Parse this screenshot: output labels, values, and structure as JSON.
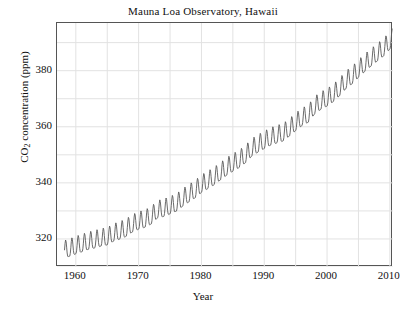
{
  "chart_data": {
    "type": "line",
    "title": "Mauna Loa Observatory, Hawaii",
    "xlabel": "Year",
    "ylabel_text": "CO",
    "ylabel_sub": "2",
    "ylabel_rest": " concentration (ppm)",
    "ylabel_full": "CO2 concentration (ppm)",
    "xlim": [
      1957.0,
      2010.5
    ],
    "ylim": [
      310.0,
      397.0
    ],
    "grid": true,
    "legend": "none",
    "xticks": [
      1960,
      1970,
      1980,
      1990,
      2000,
      2010
    ],
    "xticklabels": [
      "1960",
      "1970",
      "1980",
      "1990",
      "2000",
      "2010"
    ],
    "x_minor_step": 5,
    "yticks": [
      320,
      340,
      360,
      380
    ],
    "yticklabels": [
      "320",
      "340",
      "360",
      "380"
    ],
    "y_minor_step": 10,
    "series": [
      {
        "name": "Monthly mean CO2 (Keeling Curve)",
        "color": "#5a5a5a",
        "linewidth": 0.9,
        "description": "Monthly atmospheric CO2 concentration with annual sawtooth seasonal cycle superimposed on a rising, slightly accelerating trend",
        "seasonal_amplitude_ppm": 3.1,
        "annual_means": [
          {
            "year": 1958,
            "value": 315.3
          },
          {
            "year": 1959,
            "value": 315.98
          },
          {
            "year": 1960,
            "value": 316.91
          },
          {
            "year": 1961,
            "value": 317.64
          },
          {
            "year": 1962,
            "value": 318.45
          },
          {
            "year": 1963,
            "value": 318.99
          },
          {
            "year": 1964,
            "value": 319.62
          },
          {
            "year": 1965,
            "value": 320.04
          },
          {
            "year": 1966,
            "value": 321.37
          },
          {
            "year": 1967,
            "value": 322.18
          },
          {
            "year": 1968,
            "value": 323.05
          },
          {
            "year": 1969,
            "value": 324.62
          },
          {
            "year": 1970,
            "value": 325.68
          },
          {
            "year": 1971,
            "value": 326.32
          },
          {
            "year": 1972,
            "value": 327.46
          },
          {
            "year": 1973,
            "value": 329.68
          },
          {
            "year": 1974,
            "value": 330.19
          },
          {
            "year": 1975,
            "value": 331.12
          },
          {
            "year": 1976,
            "value": 332.03
          },
          {
            "year": 1977,
            "value": 333.84
          },
          {
            "year": 1978,
            "value": 335.41
          },
          {
            "year": 1979,
            "value": 336.84
          },
          {
            "year": 1980,
            "value": 338.76
          },
          {
            "year": 1981,
            "value": 340.12
          },
          {
            "year": 1982,
            "value": 341.48
          },
          {
            "year": 1983,
            "value": 343.15
          },
          {
            "year": 1984,
            "value": 344.87
          },
          {
            "year": 1985,
            "value": 346.35
          },
          {
            "year": 1986,
            "value": 347.61
          },
          {
            "year": 1987,
            "value": 349.31
          },
          {
            "year": 1988,
            "value": 351.69
          },
          {
            "year": 1989,
            "value": 353.12
          },
          {
            "year": 1990,
            "value": 354.39
          },
          {
            "year": 1991,
            "value": 355.61
          },
          {
            "year": 1992,
            "value": 356.45
          },
          {
            "year": 1993,
            "value": 357.1
          },
          {
            "year": 1994,
            "value": 358.83
          },
          {
            "year": 1995,
            "value": 360.82
          },
          {
            "year": 1996,
            "value": 362.61
          },
          {
            "year": 1997,
            "value": 363.73
          },
          {
            "year": 1998,
            "value": 366.7
          },
          {
            "year": 1999,
            "value": 368.38
          },
          {
            "year": 2000,
            "value": 369.55
          },
          {
            "year": 2001,
            "value": 371.14
          },
          {
            "year": 2002,
            "value": 373.28
          },
          {
            "year": 2003,
            "value": 375.8
          },
          {
            "year": 2004,
            "value": 377.52
          },
          {
            "year": 2005,
            "value": 379.8
          },
          {
            "year": 2006,
            "value": 381.9
          },
          {
            "year": 2007,
            "value": 383.79
          },
          {
            "year": 2008,
            "value": 385.6
          },
          {
            "year": 2009,
            "value": 387.43
          },
          {
            "year": 2010,
            "value": 389.9
          }
        ],
        "start_year": 1958.2,
        "end_year": 2010.4,
        "start_value_ppm": 315.3,
        "end_value_ppm": 392.5
      }
    ],
    "colors": {
      "background": "#ffffff",
      "frame": "#555555",
      "grid": "#e2e2e2",
      "text": "#111111",
      "line": "#5a5a5a"
    }
  }
}
